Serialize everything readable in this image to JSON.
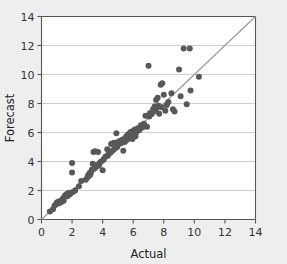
{
  "chart_data": {
    "type": "scatter",
    "title": "",
    "xlabel": "Actual",
    "ylabel": "Forecast",
    "xlim": [
      0,
      14
    ],
    "ylim": [
      0,
      14
    ],
    "xticks": [
      0,
      2,
      4,
      6,
      8,
      10,
      12,
      14
    ],
    "yticks": [
      0,
      2,
      4,
      6,
      8,
      10,
      12,
      14
    ],
    "grid": "horizontal",
    "legend": "none",
    "marker_color": "#58585a",
    "marker_size": 3,
    "plot_background": "#ffffff",
    "page_background": "#eeeeee",
    "reference_line": {
      "name": "identity-line",
      "type": "line",
      "color": "#9a9a9a",
      "from": [
        0,
        0
      ],
      "to": [
        14,
        14
      ]
    },
    "points": [
      [
        0.55,
        0.55
      ],
      [
        0.75,
        0.7
      ],
      [
        0.85,
        0.95
      ],
      [
        0.95,
        1.05
      ],
      [
        1.0,
        1.15
      ],
      [
        1.05,
        1.2
      ],
      [
        1.1,
        1.1
      ],
      [
        1.15,
        1.25
      ],
      [
        1.2,
        1.15
      ],
      [
        1.25,
        1.3
      ],
      [
        1.3,
        1.2
      ],
      [
        1.35,
        1.35
      ],
      [
        1.4,
        1.45
      ],
      [
        1.45,
        1.3
      ],
      [
        1.5,
        1.55
      ],
      [
        1.55,
        1.65
      ],
      [
        1.6,
        1.7
      ],
      [
        1.65,
        1.75
      ],
      [
        1.7,
        1.6
      ],
      [
        1.72,
        1.8
      ],
      [
        1.75,
        1.7
      ],
      [
        1.8,
        1.85
      ],
      [
        1.85,
        1.75
      ],
      [
        1.9,
        1.8
      ],
      [
        2.0,
        3.9
      ],
      [
        2.0,
        3.25
      ],
      [
        2.05,
        1.9
      ],
      [
        2.2,
        2.0
      ],
      [
        2.45,
        2.3
      ],
      [
        2.6,
        2.65
      ],
      [
        2.9,
        2.75
      ],
      [
        3.0,
        2.9
      ],
      [
        3.05,
        3.05
      ],
      [
        3.1,
        3.0
      ],
      [
        3.15,
        3.2
      ],
      [
        3.2,
        3.1
      ],
      [
        3.25,
        3.3
      ],
      [
        3.3,
        3.45
      ],
      [
        3.35,
        3.85
      ],
      [
        3.4,
        4.65
      ],
      [
        3.45,
        3.5
      ],
      [
        3.5,
        4.7
      ],
      [
        3.55,
        3.6
      ],
      [
        3.6,
        3.75
      ],
      [
        3.7,
        4.65
      ],
      [
        3.75,
        3.7
      ],
      [
        3.8,
        3.9
      ],
      [
        3.9,
        4.0
      ],
      [
        4.0,
        3.4
      ],
      [
        4.05,
        4.1
      ],
      [
        4.1,
        4.2
      ],
      [
        4.2,
        4.35
      ],
      [
        4.3,
        4.85
      ],
      [
        4.35,
        4.4
      ],
      [
        4.4,
        4.55
      ],
      [
        4.5,
        4.6
      ],
      [
        4.55,
        5.2
      ],
      [
        4.6,
        4.7
      ],
      [
        4.65,
        5.25
      ],
      [
        4.7,
        4.8
      ],
      [
        4.75,
        5.3
      ],
      [
        4.8,
        4.9
      ],
      [
        4.85,
        5.15
      ],
      [
        4.9,
        5.95
      ],
      [
        4.95,
        5.0
      ],
      [
        5.0,
        5.35
      ],
      [
        5.05,
        5.2
      ],
      [
        5.1,
        5.4
      ],
      [
        5.15,
        5.25
      ],
      [
        5.2,
        5.45
      ],
      [
        5.25,
        5.3
      ],
      [
        5.3,
        5.5
      ],
      [
        5.35,
        4.75
      ],
      [
        5.4,
        5.55
      ],
      [
        5.45,
        5.35
      ],
      [
        5.5,
        5.6
      ],
      [
        5.55,
        5.75
      ],
      [
        5.6,
        5.5
      ],
      [
        5.65,
        5.85
      ],
      [
        5.7,
        5.65
      ],
      [
        5.75,
        5.95
      ],
      [
        5.8,
        5.7
      ],
      [
        5.85,
        6.05
      ],
      [
        5.9,
        5.8
      ],
      [
        5.95,
        5.55
      ],
      [
        6.0,
        6.1
      ],
      [
        6.05,
        5.9
      ],
      [
        6.1,
        6.2
      ],
      [
        6.15,
        5.75
      ],
      [
        6.2,
        6.0
      ],
      [
        6.3,
        6.3
      ],
      [
        6.4,
        6.15
      ],
      [
        6.5,
        6.5
      ],
      [
        6.6,
        6.35
      ],
      [
        6.7,
        6.6
      ],
      [
        6.8,
        7.15
      ],
      [
        6.9,
        6.4
      ],
      [
        7.0,
        10.6
      ],
      [
        7.05,
        7.1
      ],
      [
        7.1,
        7.35
      ],
      [
        7.2,
        7.25
      ],
      [
        7.3,
        7.6
      ],
      [
        7.35,
        7.45
      ],
      [
        7.4,
        7.8
      ],
      [
        7.45,
        7.55
      ],
      [
        7.5,
        8.25
      ],
      [
        7.55,
        7.7
      ],
      [
        7.6,
        8.4
      ],
      [
        7.65,
        7.85
      ],
      [
        7.7,
        7.3
      ],
      [
        7.8,
        9.3
      ],
      [
        7.85,
        7.75
      ],
      [
        7.9,
        9.4
      ],
      [
        8.0,
        8.6
      ],
      [
        8.1,
        7.5
      ],
      [
        8.2,
        7.9
      ],
      [
        8.3,
        8.1
      ],
      [
        8.5,
        8.7
      ],
      [
        8.6,
        7.6
      ],
      [
        8.7,
        7.45
      ],
      [
        9.0,
        10.35
      ],
      [
        9.1,
        8.5
      ],
      [
        9.3,
        11.8
      ],
      [
        9.5,
        7.95
      ],
      [
        9.7,
        11.8
      ],
      [
        9.75,
        8.9
      ],
      [
        10.3,
        9.85
      ]
    ]
  }
}
